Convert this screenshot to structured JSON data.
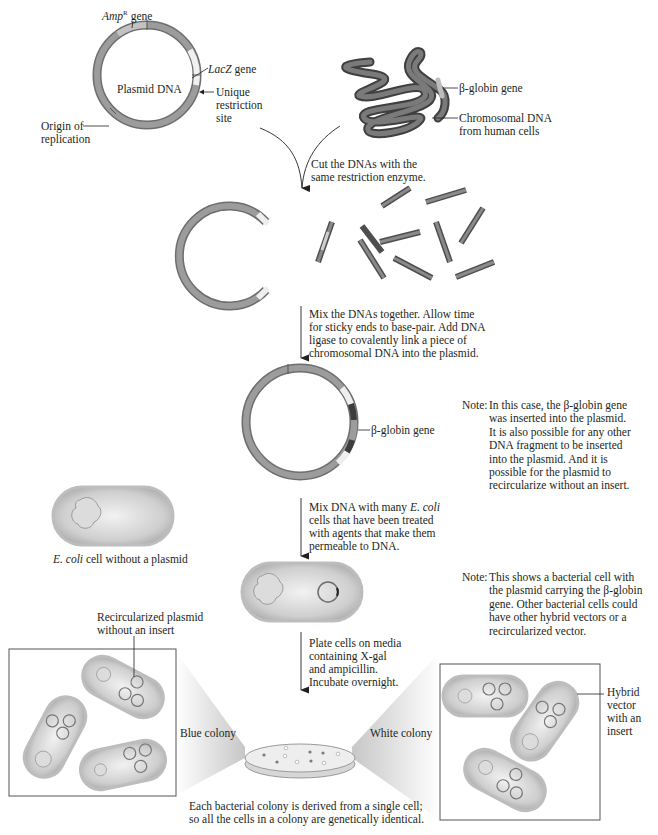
{
  "figure": {
    "top_plasmid": {
      "title": "Plasmid DNA",
      "amp_gene_italic": "Amp",
      "amp_gene_sup": "R",
      "amp_gene_suffix": " gene",
      "lacz_gene_italic": "LacZ",
      "lacz_gene_suffix": " gene",
      "restriction_site": "Unique\nrestriction\nsite",
      "origin": "Origin of\nreplication"
    },
    "chromosome": {
      "beta_globin_label": "β-globin gene",
      "chromosomal_label": "Chromosomal DNA\nfrom human cells"
    },
    "steps": {
      "cut": "Cut the DNAs with the\nsame restriction enzyme.",
      "mix": "Mix the DNAs together. Allow time\nfor sticky ends to base-pair. Add DNA\nligase to covalently link a piece of\nchromosomal DNA into the plasmid.",
      "transform_line1_prefix": "Mix DNA with many ",
      "transform_line1_italic": "E. coli",
      "transform_rest": "cells that have been treated\nwith agents that make them\npermeable to DNA.",
      "plate": "Plate cells on media\ncontaining X-gal\nand ampicillin.\nIncubate overnight."
    },
    "hybrid_plasmid": {
      "beta_globin_label": "β-globin gene"
    },
    "notes": [
      {
        "label": "Note:",
        "text": "In this case, the β-globin gene\nwas inserted into the plasmid.\nIt is also possible for any other\nDNA fragment to be inserted\ninto the plasmid. And it is\npossible for the plasmid to\nrecircularize without an insert."
      },
      {
        "label": "Note:",
        "text": "This shows a bacterial cell with\nthe plasmid carrying the β-globin\ngene. Other bacterial cells could\nhave other hybrid vectors or a\nrecircularized vector."
      }
    ],
    "ecoli_no_plasmid": {
      "caption_italic": "E. coli",
      "caption_rest": " cell without a plasmid"
    },
    "colonies": {
      "recircularized_label": "Recircularized plasmid\nwithout an insert",
      "blue_colony": "Blue colony",
      "white_colony": "White colony",
      "hybrid_label": "Hybrid\nvector\nwith an\ninsert",
      "caption": "Each bacterial colony is derived from a single cell;\nso all the cells in a colony are genetically identical."
    },
    "colors": {
      "dna_gray": "#8a8a8a",
      "dna_dark": "#5a5a5a",
      "insert_light": "#e6e6e6",
      "cell_fill": "#c9c9c9",
      "cell_border": "#a9a9a9",
      "line": "#231f20"
    }
  }
}
